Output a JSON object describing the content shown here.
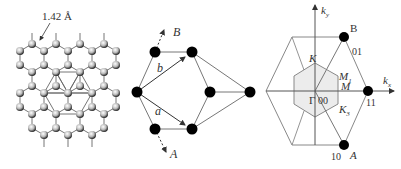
{
  "figure": {
    "panels": [
      {
        "id": "lattice",
        "description": "Graphene honeycomb lattice with shaded atoms and highlighted unit triangles",
        "bond_length_label": "1.42 Å"
      },
      {
        "id": "decorated-graph",
        "description": "Graph of black nodes with lattice vectors a and b and directions A and B",
        "labels": {
          "vector_a": "a",
          "vector_b": "b",
          "direction_A": "A",
          "direction_B": "B"
        }
      },
      {
        "id": "brillouin-zone",
        "description": "Reciprocal lattice with Brillouin zone hexagon and high-symmetry points",
        "axes": {
          "kx": "k",
          "kx_sub": "x",
          "ky": "k",
          "ky_sub": "y"
        },
        "points": {
          "gamma": "Γ",
          "origin_index": "00",
          "K": "K",
          "K3": "K",
          "K3_sub": "3",
          "M": "M",
          "M1": "M",
          "M1_sub": "1",
          "B": "B",
          "B_index": "01",
          "A": "A",
          "A_index": "10",
          "index_11": "11"
        }
      }
    ],
    "colors": {
      "line": "#777777",
      "node": "#000000",
      "shade": "#e6e6e6",
      "text": "#333333"
    }
  }
}
